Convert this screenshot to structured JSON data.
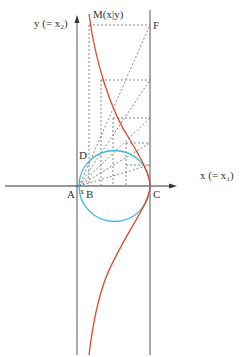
{
  "diagram": {
    "type": "geometric construction (cissoid of Diocles)",
    "colors": {
      "axis": "#333333",
      "vertical_lines": "#555555",
      "circle": "#3bb8e0",
      "curve": "#e0482a",
      "dashed": "#555555"
    },
    "labels": {
      "y_axis_main": "y (= x",
      "y_axis_sub": "2",
      "y_axis_close": ")",
      "x_axis_main": "x (= x",
      "x_axis_sub": "1",
      "x_axis_close": ")",
      "point_M": "M(x|y)",
      "point_F": "F",
      "point_D": "D",
      "point_A": "A",
      "point_B": "B",
      "point_C": "C",
      "segment_x": "x"
    }
  }
}
